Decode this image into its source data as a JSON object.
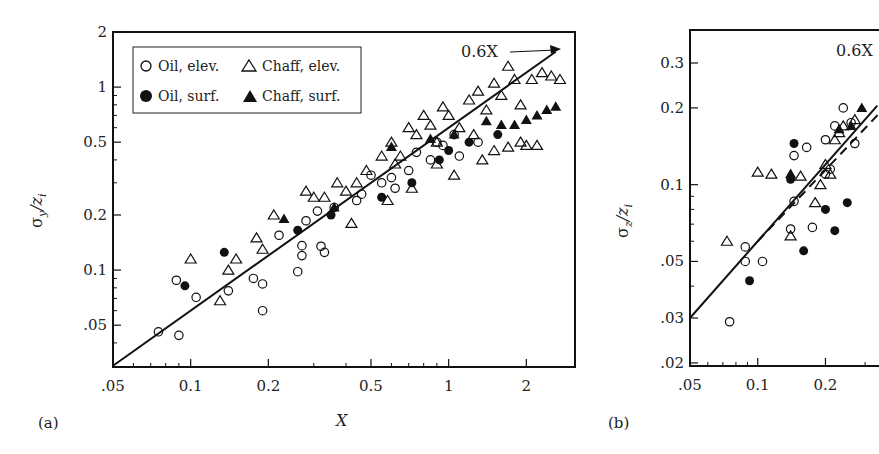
{
  "figure": {
    "panel_a_label": "(a)",
    "panel_b_label": "(b)",
    "line_annotation": "0.6X",
    "panel_a_ylabel_main": "σ",
    "panel_a_ylabel_sub": "y",
    "panel_a_ylabel_rest": "/z",
    "panel_a_ylabel_sub2": "i",
    "panel_b_ylabel_main": "σ",
    "panel_b_ylabel_sub": "z",
    "panel_b_ylabel_rest": "/z",
    "panel_b_ylabel_sub2": "i",
    "xlabel": "X",
    "legend": [
      {
        "marker": "open-circle",
        "label": "Oil, elev."
      },
      {
        "marker": "filled-circle",
        "label": "Oil, surf."
      },
      {
        "marker": "open-triangle",
        "label": "Chaff, elev."
      },
      {
        "marker": "filled-triangle",
        "label": "Chaff, surf."
      }
    ]
  },
  "chart_data": [
    {
      "type": "scatter",
      "panel": "(a)",
      "title": "",
      "xlabel": "X",
      "ylabel": "σy/zi",
      "xscale": "log",
      "yscale": "log",
      "xlim": [
        0.05,
        2.8
      ],
      "ylim": [
        0.03,
        2
      ],
      "xticks": [
        0.05,
        0.1,
        0.2,
        0.5,
        1,
        2
      ],
      "xtick_labels": [
        ".05",
        "0.1",
        "0.2",
        "0.5",
        "1",
        "2"
      ],
      "yticks": [
        0.05,
        0.1,
        0.2,
        0.5,
        1,
        2
      ],
      "ytick_labels": [
        ".05",
        "0.1",
        "0.2",
        "0.5",
        "1",
        "2"
      ],
      "grid": false,
      "legend_position": "upper left",
      "reference_lines": [
        {
          "label": "0.6X",
          "slope": 1,
          "coef": 0.6,
          "style": "solid",
          "x_range": [
            0.05,
            2.6
          ]
        }
      ],
      "series": [
        {
          "name": "Oil, elev.",
          "marker": "open-circle",
          "points": [
            [
              0.075,
              0.046
            ],
            [
              0.088,
              0.088
            ],
            [
              0.09,
              0.044
            ],
            [
              0.105,
              0.071
            ],
            [
              0.14,
              0.077
            ],
            [
              0.175,
              0.09
            ],
            [
              0.19,
              0.084
            ],
            [
              0.19,
              0.06
            ],
            [
              0.22,
              0.155
            ],
            [
              0.26,
              0.098
            ],
            [
              0.27,
              0.136
            ],
            [
              0.27,
              0.12
            ],
            [
              0.28,
              0.186
            ],
            [
              0.32,
              0.135
            ],
            [
              0.33,
              0.125
            ],
            [
              0.31,
              0.21
            ],
            [
              0.36,
              0.22
            ],
            [
              0.44,
              0.24
            ],
            [
              0.46,
              0.26
            ],
            [
              0.5,
              0.33
            ],
            [
              0.55,
              0.3
            ],
            [
              0.6,
              0.32
            ],
            [
              0.62,
              0.28
            ],
            [
              0.7,
              0.35
            ],
            [
              0.75,
              0.44
            ],
            [
              0.85,
              0.4
            ],
            [
              0.9,
              0.5
            ],
            [
              0.95,
              0.48
            ],
            [
              1.05,
              0.55
            ],
            [
              1.1,
              0.42
            ],
            [
              1.3,
              0.5
            ]
          ]
        },
        {
          "name": "Oil, surf.",
          "marker": "filled-circle",
          "points": [
            [
              0.095,
              0.082
            ],
            [
              0.135,
              0.125
            ],
            [
              0.26,
              0.165
            ],
            [
              0.35,
              0.2
            ],
            [
              0.55,
              0.25
            ],
            [
              0.72,
              0.3
            ],
            [
              0.92,
              0.4
            ],
            [
              1.0,
              0.45
            ],
            [
              1.2,
              0.5
            ],
            [
              1.55,
              0.55
            ]
          ]
        },
        {
          "name": "Chaff, elev.",
          "marker": "open-triangle",
          "points": [
            [
              0.1,
              0.115
            ],
            [
              0.13,
              0.068
            ],
            [
              0.14,
              0.1
            ],
            [
              0.15,
              0.115
            ],
            [
              0.18,
              0.15
            ],
            [
              0.19,
              0.13
            ],
            [
              0.21,
              0.2
            ],
            [
              0.28,
              0.27
            ],
            [
              0.3,
              0.25
            ],
            [
              0.33,
              0.25
            ],
            [
              0.37,
              0.3
            ],
            [
              0.4,
              0.27
            ],
            [
              0.44,
              0.3
            ],
            [
              0.42,
              0.18
            ],
            [
              0.48,
              0.35
            ],
            [
              0.55,
              0.42
            ],
            [
              0.58,
              0.24
            ],
            [
              0.6,
              0.5
            ],
            [
              0.65,
              0.42
            ],
            [
              0.7,
              0.6
            ],
            [
              0.75,
              0.55
            ],
            [
              0.72,
              0.28
            ],
            [
              0.8,
              0.7
            ],
            [
              0.85,
              0.62
            ],
            [
              0.9,
              0.5
            ],
            [
              0.95,
              0.78
            ],
            [
              1.0,
              0.7
            ],
            [
              1.05,
              0.33
            ],
            [
              1.1,
              0.6
            ],
            [
              1.2,
              0.85
            ],
            [
              1.25,
              0.55
            ],
            [
              1.3,
              0.95
            ],
            [
              1.35,
              0.4
            ],
            [
              1.4,
              0.75
            ],
            [
              1.5,
              1.05
            ],
            [
              1.6,
              0.9
            ],
            [
              1.7,
              1.3
            ],
            [
              1.8,
              1.1
            ],
            [
              1.9,
              0.8
            ],
            [
              2.0,
              0.48
            ],
            [
              2.1,
              1.1
            ],
            [
              2.3,
              1.2
            ],
            [
              2.5,
              1.15
            ],
            [
              2.7,
              1.1
            ],
            [
              1.5,
              0.45
            ],
            [
              1.7,
              0.47
            ],
            [
              1.9,
              0.5
            ],
            [
              2.2,
              0.48
            ],
            [
              0.62,
              0.38
            ],
            [
              0.9,
              0.38
            ]
          ]
        },
        {
          "name": "Chaff, surf.",
          "marker": "filled-triangle",
          "points": [
            [
              0.23,
              0.19
            ],
            [
              0.36,
              0.22
            ],
            [
              0.6,
              0.47
            ],
            [
              0.85,
              0.52
            ],
            [
              1.05,
              0.55
            ],
            [
              1.4,
              0.65
            ],
            [
              1.6,
              0.62
            ],
            [
              1.8,
              0.62
            ],
            [
              2.0,
              0.66
            ],
            [
              2.2,
              0.7
            ],
            [
              2.4,
              0.75
            ],
            [
              2.6,
              0.78
            ]
          ]
        }
      ]
    },
    {
      "type": "scatter",
      "panel": "(b)",
      "title": "",
      "xlabel": "X",
      "ylabel": "σz/zi",
      "xscale": "log",
      "yscale": "log",
      "xlim": [
        0.05,
        0.3
      ],
      "ylim": [
        0.02,
        0.35
      ],
      "xticks": [
        0.05,
        0.1,
        0.2
      ],
      "xtick_labels": [
        ".05",
        "0.1",
        "0.2"
      ],
      "yticks": [
        0.02,
        0.03,
        0.05,
        0.1,
        0.2,
        0.3
      ],
      "ytick_labels": [
        ".02",
        ".03",
        ".05",
        "0.1",
        "0.2",
        "0.3"
      ],
      "grid": false,
      "reference_lines": [
        {
          "label": "0.6X",
          "slope": 1,
          "coef": 0.6,
          "style": "solid"
        },
        {
          "label": "fit",
          "style": "dashed"
        }
      ],
      "series": [
        {
          "name": "Oil, elev.",
          "marker": "open-circle",
          "points": [
            [
              0.075,
              0.029
            ],
            [
              0.088,
              0.057
            ],
            [
              0.088,
              0.05
            ],
            [
              0.105,
              0.05
            ],
            [
              0.14,
              0.067
            ],
            [
              0.145,
              0.086
            ],
            [
              0.175,
              0.068
            ],
            [
              0.145,
              0.13
            ],
            [
              0.165,
              0.14
            ],
            [
              0.2,
              0.11
            ],
            [
              0.21,
              0.115
            ],
            [
              0.2,
              0.15
            ],
            [
              0.22,
              0.17
            ],
            [
              0.24,
              0.2
            ],
            [
              0.26,
              0.175
            ],
            [
              0.27,
              0.145
            ]
          ]
        },
        {
          "name": "Oil, surf.",
          "marker": "filled-circle",
          "points": [
            [
              0.092,
              0.042
            ],
            [
              0.145,
              0.145
            ],
            [
              0.16,
              0.055
            ],
            [
              0.2,
              0.08
            ],
            [
              0.22,
              0.066
            ],
            [
              0.25,
              0.085
            ],
            [
              0.14,
              0.105
            ]
          ]
        },
        {
          "name": "Chaff, elev.",
          "marker": "open-triangle",
          "points": [
            [
              0.073,
              0.06
            ],
            [
              0.1,
              0.112
            ],
            [
              0.115,
              0.11
            ],
            [
              0.14,
              0.063
            ],
            [
              0.155,
              0.108
            ],
            [
              0.18,
              0.085
            ],
            [
              0.19,
              0.1
            ],
            [
              0.2,
              0.12
            ],
            [
              0.22,
              0.15
            ],
            [
              0.23,
              0.16
            ],
            [
              0.24,
              0.17
            ],
            [
              0.27,
              0.18
            ],
            [
              0.21,
              0.11
            ]
          ]
        },
        {
          "name": "Chaff, surf.",
          "marker": "filled-triangle",
          "points": [
            [
              0.14,
              0.11
            ],
            [
              0.23,
              0.165
            ],
            [
              0.26,
              0.17
            ],
            [
              0.29,
              0.2
            ]
          ]
        }
      ]
    }
  ]
}
